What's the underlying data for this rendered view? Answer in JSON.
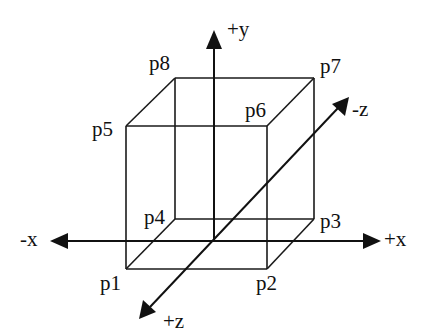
{
  "diagram": {
    "title": "",
    "colors": {
      "stroke": "#111111",
      "background": "#ffffff"
    },
    "axes": [
      {
        "name": "+y",
        "label": "+y"
      },
      {
        "name": "-x",
        "label": "-x"
      },
      {
        "name": "+x",
        "label": "+x"
      },
      {
        "name": "-z",
        "label": "-z"
      },
      {
        "name": "+z",
        "label": "+z"
      }
    ],
    "vertices": [
      {
        "id": "p1",
        "label": "p1"
      },
      {
        "id": "p2",
        "label": "p2"
      },
      {
        "id": "p3",
        "label": "p3"
      },
      {
        "id": "p4",
        "label": "p4"
      },
      {
        "id": "p5",
        "label": "p5"
      },
      {
        "id": "p6",
        "label": "p6"
      },
      {
        "id": "p7",
        "label": "p7"
      },
      {
        "id": "p8",
        "label": "p8"
      }
    ],
    "edges": [
      [
        "p1",
        "p2"
      ],
      [
        "p2",
        "p3"
      ],
      [
        "p3",
        "p4"
      ],
      [
        "p4",
        "p1"
      ],
      [
        "p5",
        "p6"
      ],
      [
        "p6",
        "p7"
      ],
      [
        "p7",
        "p8"
      ],
      [
        "p8",
        "p5"
      ],
      [
        "p1",
        "p5"
      ],
      [
        "p2",
        "p6"
      ],
      [
        "p3",
        "p7"
      ],
      [
        "p4",
        "p8"
      ]
    ]
  }
}
